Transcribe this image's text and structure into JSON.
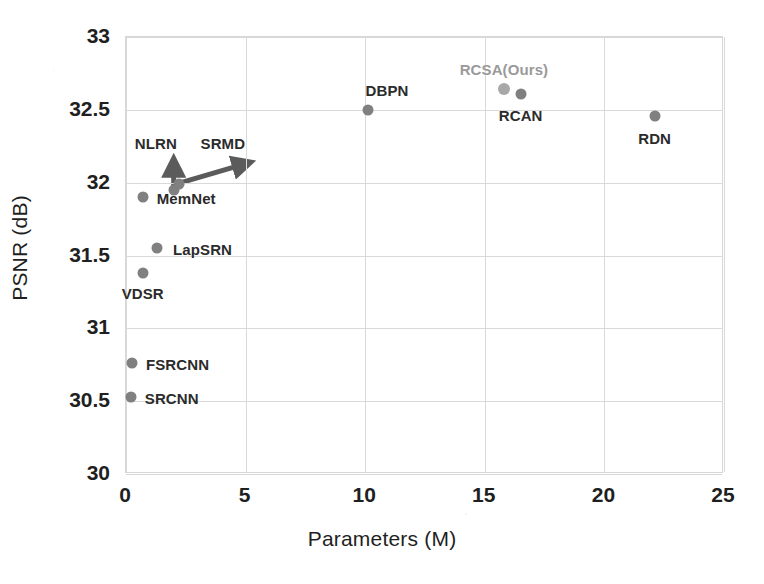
{
  "chart_data": {
    "type": "scatter",
    "title": "",
    "xlabel": "Parameters (M)",
    "ylabel": "PSNR (dB)",
    "xlim": [
      0,
      25
    ],
    "ylim": [
      30,
      33
    ],
    "xticks": [
      "0",
      "5",
      "10",
      "15",
      "20",
      "25"
    ],
    "yticks": [
      "30",
      "30.5",
      "31",
      "31.5",
      "32",
      "32.5",
      "33"
    ],
    "grid": true,
    "legend": "none",
    "colors": {
      "marker": "#808080",
      "marker_highlight": "#a8a8a8",
      "grid": "#d9d9d9",
      "axis_text": "#1f1f1f",
      "label_text": "#2b2b2b",
      "label_highlight_text": "#9a9a9a"
    },
    "points": [
      {
        "name": "SRCNN",
        "x": 0.2,
        "y": 30.53,
        "label": "SRCNN",
        "label_dx": 14,
        "label_dy": 1,
        "highlight": false
      },
      {
        "name": "FSRCNN",
        "x": 0.25,
        "y": 30.76,
        "label": "FSRCNN",
        "label_dx": 14,
        "label_dy": 1,
        "highlight": false
      },
      {
        "name": "VDSR",
        "x": 0.7,
        "y": 31.38,
        "label": "VDSR",
        "label_dx": 0,
        "label_dy": 20,
        "highlight": false
      },
      {
        "name": "LapSRN",
        "x": 1.3,
        "y": 31.55,
        "label": "LapSRN",
        "label_dx": 16,
        "label_dy": 1,
        "highlight": false
      },
      {
        "name": "MemNet",
        "x": 0.7,
        "y": 31.9,
        "label": "MemNet",
        "label_dx": 14,
        "label_dy": 1,
        "highlight": false
      },
      {
        "name": "NLRN",
        "x": 2.0,
        "y": 31.95,
        "label": "",
        "label_dx": 0,
        "label_dy": 0,
        "highlight": false
      },
      {
        "name": "SRMD",
        "x": 2.2,
        "y": 31.99,
        "label": "",
        "label_dx": 0,
        "label_dy": 0,
        "highlight": false
      },
      {
        "name": "DBPN",
        "x": 10.1,
        "y": 32.5,
        "label": "DBPN",
        "label_dx": -2,
        "label_dy": -20,
        "highlight": false
      },
      {
        "name": "RCSA(Ours)",
        "x": 15.8,
        "y": 32.64,
        "label": "RCSA(Ours)",
        "label_dx": 0,
        "label_dy": -20,
        "highlight": true
      },
      {
        "name": "RCAN",
        "x": 16.5,
        "y": 32.61,
        "label": "RCAN",
        "label_dx": 0,
        "label_dy": 21,
        "highlight": false
      },
      {
        "name": "RDN",
        "x": 22.1,
        "y": 32.46,
        "label": "RDN",
        "label_dx": 0,
        "label_dy": 22,
        "highlight": false
      }
    ],
    "annotations": [
      {
        "name": "NLRN",
        "label": "NLRN",
        "kind": "arrow",
        "from": {
          "x": 2.0,
          "y": 31.95
        },
        "to": {
          "x": 2.0,
          "y": 32.14
        },
        "label_x": 1.25,
        "label_y": 32.27
      },
      {
        "name": "SRMD",
        "label": "SRMD",
        "kind": "arrow",
        "from": {
          "x": 2.2,
          "y": 31.99
        },
        "to": {
          "x": 5.1,
          "y": 32.13
        },
        "label_x": 4.05,
        "label_y": 32.27
      }
    ]
  }
}
